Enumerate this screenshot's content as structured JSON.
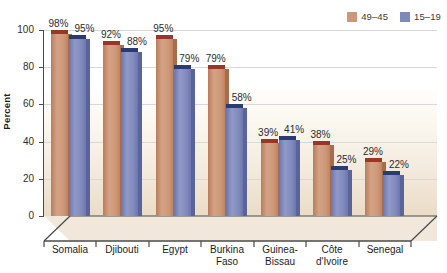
{
  "chart_data": {
    "type": "bar",
    "title": "",
    "subtitle": "",
    "xlabel": "",
    "ylabel": "Percent",
    "ylim": [
      0,
      100
    ],
    "yticks": [
      0,
      20,
      40,
      60,
      80,
      100
    ],
    "grid": true,
    "legend_position": "top-right",
    "categories": [
      "Somalia",
      "Djibouti",
      "Egypt",
      "Burkina\nFaso",
      "Guinea-\nBissau",
      "Côte\nd'Ivoire",
      "Senegal"
    ],
    "series": [
      {
        "name": "49–45",
        "color": "#cd9878",
        "values": [
          98,
          92,
          95,
          79,
          39,
          38,
          29
        ],
        "labels": [
          "98%",
          "92%",
          "95%",
          "79%",
          "39%",
          "38%",
          "29%"
        ]
      },
      {
        "name": "15–19",
        "color": "#8089bd",
        "values": [
          95,
          88,
          79,
          58,
          41,
          25,
          22
        ],
        "labels": [
          "95%",
          "88%",
          "79%",
          "58%",
          "41%",
          "25%",
          "22%"
        ]
      }
    ]
  },
  "axis": {
    "ylabel": "Percent",
    "ytick_labels": [
      "100",
      "80",
      "60",
      "40",
      "20",
      "0"
    ]
  },
  "legend": {
    "items": [
      {
        "label": "49–45",
        "swatch": "#cd9878"
      },
      {
        "label": "15–19",
        "swatch": "#8089bd"
      }
    ]
  },
  "colors": {
    "series_1": "#cd9878",
    "series_2": "#8089bd",
    "axis": "#4a4a4a",
    "gridline": "#d8d8d8",
    "background_top": "#ffffff",
    "background_bottom": "#eadcc6"
  }
}
